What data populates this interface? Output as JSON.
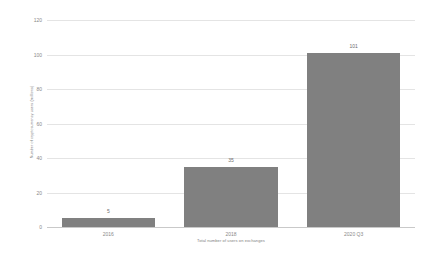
{
  "chart_data": {
    "type": "bar",
    "title": "",
    "categories": [
      "2016",
      "2018",
      "2020 Q3"
    ],
    "values": [
      5,
      35,
      101
    ],
    "value_labels": [
      "5",
      "35",
      "101"
    ],
    "xlabel": "Total number of users on exchanges",
    "ylabel": "Number of cryptocurrency users (millions)",
    "ylim": [
      0,
      120
    ],
    "yticks": [
      0,
      20,
      40,
      60,
      80,
      100,
      120
    ],
    "ytick_labels": [
      "0",
      "20",
      "40",
      "60",
      "80",
      "100",
      "120"
    ],
    "grid": true,
    "legend": false,
    "bar_color": "#808080",
    "gridline_color": "#e4e4e4",
    "axis_color": "#c9c9c9",
    "tick_text_color": "#8a8a8a",
    "background": "#ffffff"
  }
}
